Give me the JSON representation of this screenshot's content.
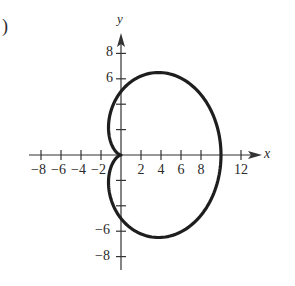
{
  "panel_label": ")",
  "chart_data": {
    "type": "line",
    "title": "",
    "equation": "r = 5 + 5cos(theta)",
    "curve_name": "cardioid",
    "xlabel": "x",
    "ylabel": "y",
    "xlim": [
      -9,
      14
    ],
    "ylim": [
      -9,
      9.5
    ],
    "x_ticks": [
      -8,
      -6,
      -4,
      -2,
      2,
      4,
      6,
      8,
      10,
      12
    ],
    "x_tick_labels": [
      "-8",
      "-6",
      "-4",
      "-2",
      "2",
      "4",
      "6",
      "8",
      "",
      "12"
    ],
    "y_ticks": [
      -8,
      -6,
      -4,
      -2,
      2,
      4,
      6,
      8
    ],
    "y_tick_labels": [
      "-8",
      "-6",
      "",
      "",
      "",
      "",
      "6",
      "8"
    ],
    "grid": false,
    "series": [
      {
        "name": "cardioid",
        "a": 5,
        "b": 5,
        "samples": 240,
        "color": "#1e1e1e",
        "stroke_width": 3.2
      }
    ],
    "key_points": [
      {
        "x": 0,
        "y": 0,
        "note": "cusp"
      },
      {
        "x": 10,
        "y": 0
      },
      {
        "x": 0,
        "y": 5
      },
      {
        "x": 0,
        "y": -5
      },
      {
        "x": 3.75,
        "y": 6.5
      },
      {
        "x": 3.75,
        "y": -6.5
      }
    ]
  },
  "layout": {
    "origin": [
      121,
      155
    ],
    "px_per_unit_x": 10,
    "px_per_unit_y": 12.7,
    "axis_color": "#333333"
  }
}
